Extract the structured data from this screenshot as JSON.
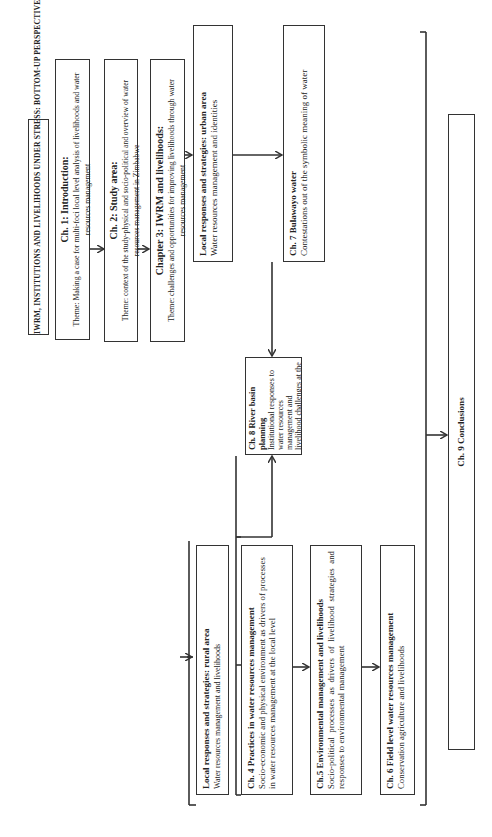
{
  "title": "IWRM, INSTITUTIONS AND LIVELIHOODS UNDER STRESS: BOTTOM-UP PERSPECTIVES FROM ZIMBABWE",
  "ch1": {
    "heading": "Ch. 1: Introduction:",
    "theme": "Theme: Making a case for multi-foci local level analysis of livelihoods and water resources management"
  },
  "ch2": {
    "heading": "Ch. 2: Study area:",
    "theme": "Theme: context of the study-physical and socio-political  and overview of water resources management in Zimbabwe"
  },
  "ch3": {
    "heading": "Chapter 3: IWRM and livelihoods:",
    "theme": "Theme: challenges and opportunities for improving livelihoods through water resources management"
  },
  "urban": {
    "heading": "Local responses and strategies: urban area",
    "text": "Water resources management and identities"
  },
  "ch7": {
    "heading": "Ch. 7 Bulawayo water",
    "text": "Contestations out of the  symbolic meaning of water"
  },
  "ch8": {
    "heading": "Ch. 8 River basin planning",
    "text": "Institutional responses to water resources management and livelihood challenges at the local level"
  },
  "rural": {
    "heading": "Local responses and strategies: rural area",
    "text": "Water resources management and livelihoods"
  },
  "ch4": {
    "heading": "Ch. 4 Practices in water resources management",
    "text": "Socio-economic  and physical environment as drivers of processes in water resources management at the local level"
  },
  "ch5": {
    "heading": "Ch.5 Environmental management and livelihoods",
    "text": "Socio-political  processes  as  drivers  of  livelihood strategies and responses to environmental management"
  },
  "ch6": {
    "heading": "Ch. 6 Field level water resources management",
    "text": "Conservation agriculture and livelihoods"
  },
  "ch9": {
    "heading": "Ch. 9 Conclusions"
  }
}
